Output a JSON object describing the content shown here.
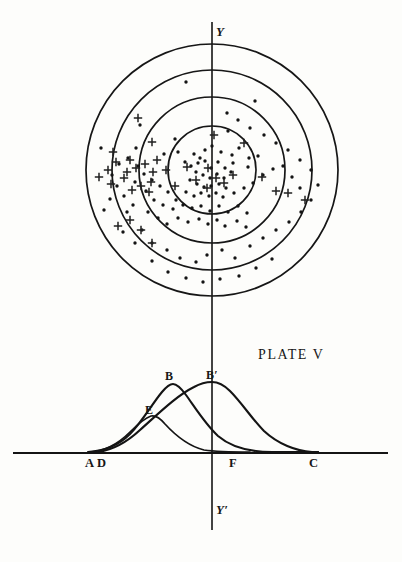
{
  "plate": {
    "caption": "PLATE V",
    "title_position": {
      "x": 258,
      "y": 348
    }
  },
  "axes": {
    "vertical_top_label": "Y",
    "vertical_bottom_label": "Y′",
    "vertical_x": 212,
    "vertical_top_y": 22,
    "vertical_bottom_y": 530,
    "baseline_y": 453,
    "baseline_x0": 13,
    "baseline_x1": 388
  },
  "target_diagram": {
    "center": {
      "x": 212,
      "y": 170
    },
    "rings": [
      {
        "name": "ring-outer",
        "radius": 126
      },
      {
        "name": "ring-third",
        "radius": 100
      },
      {
        "name": "ring-second",
        "radius": 73
      },
      {
        "name": "ring-inner",
        "radius": 44
      }
    ],
    "dots": [
      [
        186,
        82
      ],
      [
        255,
        101
      ],
      [
        227,
        113
      ],
      [
        228,
        131
      ],
      [
        140,
        125
      ],
      [
        175,
        139
      ],
      [
        136,
        148
      ],
      [
        101,
        148
      ],
      [
        178,
        152
      ],
      [
        164,
        154
      ],
      [
        194,
        154
      ],
      [
        200,
        158
      ],
      [
        205,
        150
      ],
      [
        212,
        146
      ],
      [
        221,
        152
      ],
      [
        232,
        155
      ],
      [
        239,
        148
      ],
      [
        249,
        158
      ],
      [
        258,
        156
      ],
      [
        248,
        167
      ],
      [
        185,
        162
      ],
      [
        191,
        166
      ],
      [
        198,
        163
      ],
      [
        205,
        161
      ],
      [
        211,
        168
      ],
      [
        218,
        162
      ],
      [
        225,
        168
      ],
      [
        233,
        163
      ],
      [
        196,
        172
      ],
      [
        203,
        175
      ],
      [
        210,
        178
      ],
      [
        217,
        174
      ],
      [
        224,
        178
      ],
      [
        231,
        172
      ],
      [
        190,
        180
      ],
      [
        197,
        184
      ],
      [
        204,
        187
      ],
      [
        211,
        186
      ],
      [
        219,
        184
      ],
      [
        226,
        188
      ],
      [
        186,
        192
      ],
      [
        194,
        196
      ],
      [
        201,
        193
      ],
      [
        209,
        196
      ],
      [
        216,
        193
      ],
      [
        223,
        197
      ],
      [
        234,
        193
      ],
      [
        244,
        188
      ],
      [
        253,
        183
      ],
      [
        263,
        175
      ],
      [
        273,
        169
      ],
      [
        283,
        166
      ],
      [
        292,
        177
      ],
      [
        300,
        188
      ],
      [
        176,
        200
      ],
      [
        168,
        192
      ],
      [
        160,
        186
      ],
      [
        152,
        180
      ],
      [
        146,
        191
      ],
      [
        154,
        200
      ],
      [
        163,
        205
      ],
      [
        173,
        209
      ],
      [
        183,
        205
      ],
      [
        192,
        208
      ],
      [
        201,
        206
      ],
      [
        210,
        211
      ],
      [
        219,
        206
      ],
      [
        228,
        212
      ],
      [
        238,
        206
      ],
      [
        247,
        213
      ],
      [
        178,
        218
      ],
      [
        188,
        222
      ],
      [
        199,
        219
      ],
      [
        208,
        224
      ],
      [
        217,
        220
      ],
      [
        225,
        226
      ],
      [
        237,
        221
      ],
      [
        246,
        227
      ],
      [
        167,
        224
      ],
      [
        158,
        218
      ],
      [
        148,
        212
      ],
      [
        133,
        205
      ],
      [
        124,
        196
      ],
      [
        117,
        186
      ],
      [
        112,
        175
      ],
      [
        119,
        164
      ],
      [
        128,
        158
      ],
      [
        138,
        166
      ],
      [
        144,
        174
      ],
      [
        135,
        182
      ],
      [
        127,
        212
      ],
      [
        142,
        230
      ],
      [
        152,
        243
      ],
      [
        167,
        250
      ],
      [
        180,
        258
      ],
      [
        196,
        262
      ],
      [
        207,
        255
      ],
      [
        222,
        250
      ],
      [
        235,
        258
      ],
      [
        250,
        246
      ],
      [
        263,
        238
      ],
      [
        276,
        230
      ],
      [
        289,
        222
      ],
      [
        301,
        212
      ],
      [
        311,
        200
      ],
      [
        318,
        185
      ],
      [
        311,
        170
      ],
      [
        300,
        160
      ],
      [
        288,
        150
      ],
      [
        276,
        143
      ],
      [
        264,
        135
      ],
      [
        250,
        128
      ],
      [
        238,
        120
      ],
      [
        110,
        199
      ],
      [
        104,
        210
      ],
      [
        123,
        232
      ],
      [
        135,
        243
      ],
      [
        152,
        261
      ],
      [
        168,
        272
      ],
      [
        186,
        278
      ],
      [
        203,
        282
      ],
      [
        220,
        279
      ],
      [
        239,
        276
      ],
      [
        256,
        268
      ],
      [
        272,
        259
      ]
    ],
    "plus_marks": [
      [
        138,
        118
      ],
      [
        152,
        142
      ],
      [
        130,
        160
      ],
      [
        116,
        162
      ],
      [
        108,
        170
      ],
      [
        111,
        184
      ],
      [
        127,
        172
      ],
      [
        136,
        168
      ],
      [
        145,
        164
      ],
      [
        153,
        172
      ],
      [
        151,
        182
      ],
      [
        141,
        186
      ],
      [
        132,
        190
      ],
      [
        124,
        178
      ],
      [
        149,
        192
      ],
      [
        157,
        160
      ],
      [
        166,
        170
      ],
      [
        175,
        186
      ],
      [
        187,
        167
      ],
      [
        196,
        180
      ],
      [
        207,
        188
      ],
      [
        216,
        178
      ],
      [
        208,
        168
      ],
      [
        224,
        183
      ],
      [
        233,
        175
      ],
      [
        214,
        135
      ],
      [
        244,
        143
      ],
      [
        262,
        177
      ],
      [
        276,
        191
      ],
      [
        288,
        193
      ],
      [
        305,
        200
      ],
      [
        130,
        220
      ],
      [
        141,
        230
      ],
      [
        152,
        243
      ],
      [
        118,
        226
      ],
      [
        113,
        152
      ],
      [
        99,
        177
      ]
    ],
    "dot_radius": 1.7,
    "plus_size": 4.2
  },
  "curve_diagram": {
    "labels": [
      {
        "id": "label-b",
        "text": "B",
        "x": 165,
        "y": 370
      },
      {
        "id": "label-bp",
        "text": "B′",
        "x": 206,
        "y": 369
      },
      {
        "id": "label-e",
        "text": "E",
        "x": 145,
        "y": 404
      },
      {
        "id": "label-a",
        "text": "A",
        "x": 85,
        "y": 457
      },
      {
        "id": "label-d",
        "text": "D",
        "x": 97,
        "y": 457
      },
      {
        "id": "label-f",
        "text": "F",
        "x": 229,
        "y": 457
      },
      {
        "id": "label-c",
        "text": "C",
        "x": 309,
        "y": 457
      }
    ],
    "curves": [
      {
        "id": "curve-b",
        "name": "curve-B-left-peak",
        "peak_label": "B",
        "peak": {
          "x": 172,
          "y": 385
        },
        "start": {
          "x": 88,
          "y": 452
        },
        "end": {
          "x": 318,
          "y": 452
        }
      },
      {
        "id": "curve-bprime",
        "name": "curve-B-prime-right-peak",
        "peak_label": "B′",
        "peak": {
          "x": 212,
          "y": 383
        },
        "start": {
          "x": 98,
          "y": 452
        },
        "end": {
          "x": 318,
          "y": 452
        }
      },
      {
        "id": "curve-e",
        "name": "curve-E-low-peak",
        "peak_label": "E",
        "peak": {
          "x": 152,
          "y": 417
        },
        "start": {
          "x": 90,
          "y": 452
        },
        "end": {
          "x": 250,
          "y": 452
        }
      }
    ]
  },
  "chart_data": {
    "type": "line",
    "title": "PLATE V",
    "xlabel": "",
    "ylabel": "",
    "grid": false,
    "legend": "none",
    "baseline_points": [
      "A",
      "D",
      "F",
      "C"
    ],
    "axis_labels": [
      "Y",
      "Y′"
    ],
    "series": [
      {
        "name": "B",
        "peak_label": "B",
        "peak_x": 172,
        "peak_height": 68,
        "foot_left": "A",
        "foot_right": "C"
      },
      {
        "name": "B′",
        "peak_label": "B′",
        "peak_x": 212,
        "peak_height": 70,
        "foot_left": "D",
        "foot_right": "C"
      },
      {
        "name": "E",
        "peak_label": "E",
        "peak_x": 152,
        "peak_height": 36,
        "foot_left": "D",
        "foot_right": "F"
      }
    ],
    "target": {
      "ring_count": 4,
      "ring_radii": [
        44,
        73,
        100,
        126
      ],
      "dot_count": 124,
      "plus_count": 37,
      "center_label": "origin of Y-Y′ axis"
    }
  }
}
